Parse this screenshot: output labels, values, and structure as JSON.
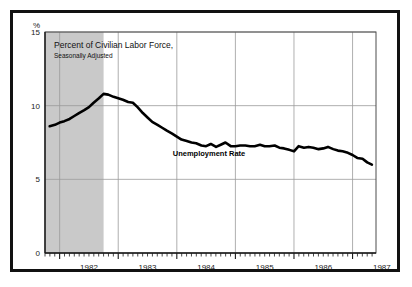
{
  "figure": {
    "unit_symbol": "%",
    "title_line1": "Percent of Civilian Labor Force,",
    "title_line2": "Seasonally Adjusted",
    "series_label": "Unemployment Rate",
    "frame_color": "#111111",
    "line_color": "#000000",
    "shade_color": "#c9c9c9",
    "grid_color": "#9a9a9a",
    "background_color": "#ffffff"
  },
  "chart_data": {
    "type": "line",
    "title": "Percent of Civilian Labor Force, Seasonally Adjusted",
    "xlabel": "",
    "ylabel": "%",
    "ylim": [
      0,
      15
    ],
    "yticks": [
      0,
      5,
      10,
      15
    ],
    "ytick_labels": [
      "0",
      "5",
      "10",
      "15"
    ],
    "xlim": [
      1981.75,
      1987.4
    ],
    "xticks": [
      1982,
      1983,
      1984,
      1985,
      1986,
      1987
    ],
    "xtick_labels": [
      "1982",
      "1983",
      "1984",
      "1985",
      "1986",
      "1987"
    ],
    "minor_xticks": "monthly",
    "grid": true,
    "legend": "inline-annotation",
    "annotations": [
      {
        "text": "Unemployment Rate",
        "x": 1984.55,
        "y": 6.55
      }
    ],
    "shaded_regions": [
      {
        "label": "recession",
        "x0": 1981.75,
        "x1": 1982.75,
        "color": "#c9c9c9"
      }
    ],
    "series": [
      {
        "name": "Unemployment Rate",
        "x": [
          1981.83,
          1981.92,
          1982.0,
          1982.08,
          1982.17,
          1982.25,
          1982.33,
          1982.42,
          1982.5,
          1982.58,
          1982.67,
          1982.75,
          1982.83,
          1982.92,
          1983.0,
          1983.08,
          1983.17,
          1983.25,
          1983.33,
          1983.42,
          1983.5,
          1983.58,
          1983.67,
          1983.75,
          1983.83,
          1983.92,
          1984.0,
          1984.08,
          1984.17,
          1984.25,
          1984.33,
          1984.42,
          1984.5,
          1984.58,
          1984.67,
          1984.75,
          1984.83,
          1984.92,
          1985.0,
          1985.08,
          1985.17,
          1985.25,
          1985.33,
          1985.42,
          1985.5,
          1985.58,
          1985.67,
          1985.75,
          1985.83,
          1985.92,
          1986.0,
          1986.08,
          1986.17,
          1986.25,
          1986.33,
          1986.42,
          1986.5,
          1986.58,
          1986.67,
          1986.75,
          1986.83,
          1986.92,
          1987.0,
          1987.08,
          1987.17,
          1987.25,
          1987.33
        ],
        "y": [
          8.6,
          8.7,
          8.85,
          8.95,
          9.1,
          9.3,
          9.5,
          9.7,
          9.9,
          10.2,
          10.5,
          10.8,
          10.75,
          10.6,
          10.5,
          10.4,
          10.25,
          10.2,
          9.9,
          9.5,
          9.2,
          8.9,
          8.7,
          8.5,
          8.3,
          8.1,
          7.9,
          7.7,
          7.6,
          7.5,
          7.45,
          7.3,
          7.25,
          7.4,
          7.2,
          7.35,
          7.5,
          7.25,
          7.25,
          7.3,
          7.3,
          7.25,
          7.25,
          7.35,
          7.25,
          7.25,
          7.3,
          7.15,
          7.1,
          7.0,
          6.9,
          7.25,
          7.15,
          7.2,
          7.15,
          7.05,
          7.1,
          7.2,
          7.05,
          6.95,
          6.9,
          6.8,
          6.65,
          6.45,
          6.4,
          6.15,
          6.0
        ]
      }
    ]
  }
}
